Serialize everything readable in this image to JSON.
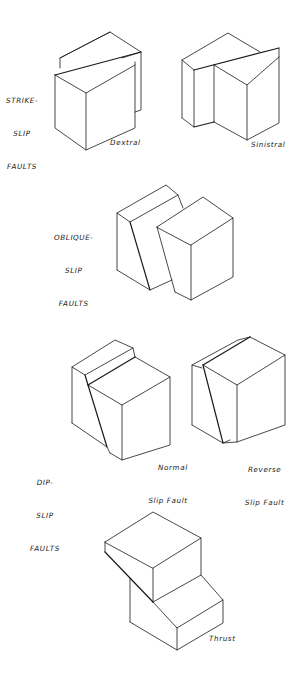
{
  "diagram": {
    "groups": [
      {
        "id": "strike-slip",
        "label_lines": [
          "STRIKE-",
          "SLIP",
          "FAULTS"
        ],
        "blocks": [
          {
            "id": "dextral",
            "caption": "Dextral"
          },
          {
            "id": "sinistral",
            "caption": "Sinistral"
          }
        ]
      },
      {
        "id": "oblique-slip",
        "label_lines": [
          "OBLIQUE-",
          "SLIP",
          "FAULTS"
        ],
        "blocks": []
      },
      {
        "id": "dip-slip",
        "label_lines": [
          "DIP-",
          "SLIP",
          "FAULTS"
        ],
        "blocks": [
          {
            "id": "normal",
            "caption_lines": [
              "Normal",
              "Slip Fault"
            ]
          },
          {
            "id": "reverse",
            "caption_lines": [
              "Reverse",
              "Slip Fault"
            ]
          }
        ]
      },
      {
        "id": "thrust",
        "blocks": [
          {
            "id": "thrust",
            "caption": "Thrust"
          }
        ]
      }
    ],
    "colors": {
      "line": "#1a1a1a",
      "background": "#ffffff"
    }
  }
}
